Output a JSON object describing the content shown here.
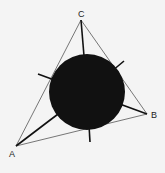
{
  "diagram": {
    "type": "triangle-with-incircle",
    "vertices": [
      {
        "label": "A",
        "x": 16,
        "y": 146
      },
      {
        "label": "B",
        "x": 147,
        "y": 114
      },
      {
        "label": "C",
        "x": 81,
        "y": 20
      }
    ],
    "circle": {
      "cx": 87,
      "cy": 92,
      "r": 38,
      "fill": "#111111"
    },
    "colors": {
      "background": "#f4f4f4",
      "edge": "#555555",
      "segment": "#111111"
    }
  }
}
